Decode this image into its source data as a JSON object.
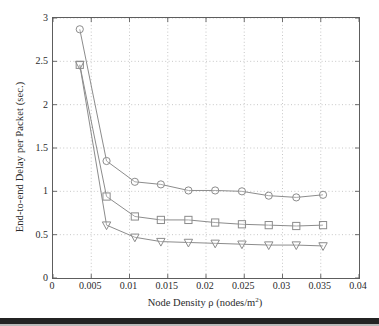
{
  "chart_data": {
    "type": "line",
    "title": "",
    "xlabel": "Node Density ρ (nodes/m²)",
    "xlabel_prefix": "Node Density ρ (nodes/m",
    "xlabel_superscript": "2",
    "xlabel_suffix": ")",
    "ylabel": "End-to-end Delay per Packet (sec.)",
    "xlim": [
      0,
      0.04
    ],
    "ylim": [
      0,
      3
    ],
    "xticks": [
      0,
      0.005,
      0.01,
      0.015,
      0.02,
      0.025,
      0.03,
      0.035,
      0.04
    ],
    "xtick_labels": [
      "0",
      "0.005",
      "0.01",
      "0.015",
      "0.02",
      "0.025",
      "0.03",
      "0.035",
      "0.04"
    ],
    "yticks": [
      0,
      0.5,
      1,
      1.5,
      2,
      2.5,
      3
    ],
    "ytick_labels": [
      "0",
      "0.5",
      "1",
      "1.5",
      "2",
      "2.5",
      "3"
    ],
    "grid": true,
    "grid_style": "dotted",
    "grid_color": "#b9b9b9",
    "axis_color": "#5d5d5d",
    "legend": "none",
    "x": [
      0.0035,
      0.007,
      0.0107,
      0.0141,
      0.0177,
      0.0212,
      0.0247,
      0.0282,
      0.0318,
      0.0353
    ],
    "series": [
      {
        "name": "circle-series",
        "marker": "circle",
        "color": "#8c8c8c",
        "values": [
          2.87,
          1.35,
          1.11,
          1.08,
          1.01,
          1.01,
          1.0,
          0.95,
          0.93,
          0.96
        ]
      },
      {
        "name": "square-series",
        "marker": "square",
        "color": "#8c8c8c",
        "values": [
          2.46,
          0.94,
          0.71,
          0.67,
          0.67,
          0.64,
          0.62,
          0.61,
          0.6,
          0.61
        ]
      },
      {
        "name": "triangle-series",
        "marker": "triangle-down",
        "color": "#8c8c8c",
        "values": [
          2.46,
          0.61,
          0.47,
          0.42,
          0.41,
          0.4,
          0.39,
          0.38,
          0.38,
          0.37
        ]
      }
    ]
  }
}
